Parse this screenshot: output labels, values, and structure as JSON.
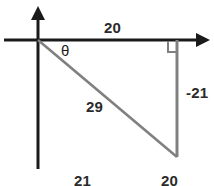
{
  "figure": {
    "colors": {
      "axis": "#1a1a1a",
      "triangle": "#808080",
      "text": "#2b2b2b",
      "background": "#ffffff"
    },
    "axes": {
      "x_axis": {
        "name": "horizontal-axis",
        "has_arrow_right": true
      },
      "y_axis": {
        "name": "vertical-axis",
        "has_arrow_up": true
      }
    },
    "labels": {
      "adjacent_top": "20",
      "angle": "θ",
      "opposite_right": "-21",
      "hypotenuse": "29",
      "bottom_left": "21",
      "bottom_right": "20"
    },
    "geometry": {
      "origin": {
        "x": 38,
        "y": 40
      },
      "right_angle_vertex": {
        "x": 177,
        "y": 40
      },
      "lower_vertex": {
        "x": 177,
        "y": 157
      },
      "right_angle_marker": true
    }
  }
}
